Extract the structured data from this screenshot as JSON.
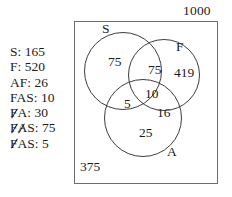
{
  "diagram": {
    "type": "venn-3-set",
    "universal_set_total": "1000",
    "outside_all_sets": "375",
    "set_labels": {
      "s": "S",
      "f": "F",
      "a": "A"
    },
    "regions": {
      "s_only": "75",
      "s_and_f_only": "75",
      "f_only": "419",
      "s_and_a_only": "5",
      "all_three": "10",
      "f_and_a_only": "16",
      "a_only": "25"
    }
  },
  "given_values": [
    {
      "term": "S",
      "value": "165",
      "text": "S: 165",
      "struck_letters": []
    },
    {
      "term": "F",
      "value": "520",
      "text": "F: 520",
      "struck_letters": []
    },
    {
      "term": "AF",
      "value": "26",
      "text": "AF: 26",
      "struck_letters": []
    },
    {
      "term": "FAS",
      "value": "10",
      "text": "FAS: 10",
      "struck_letters": []
    },
    {
      "term": "FA",
      "value": "30",
      "text": "FA: 30",
      "struck_letters": [
        "F"
      ]
    },
    {
      "term": "FAS",
      "value": "75",
      "text": "FAS: 75",
      "struck_letters": [
        "F",
        "A"
      ]
    },
    {
      "term": "FAS",
      "value": "5",
      "text": "FAS: 5",
      "struck_letters": [
        "F"
      ]
    }
  ],
  "given_list_lines": {
    "l0_label": "S:",
    "l0_value": "165",
    "l1_label": "F:",
    "l1_value": "520",
    "l2_label": "AF:",
    "l2_value": "26",
    "l3_label": "FAS:",
    "l3_value": "10",
    "l4_f": "F",
    "l4_rest": "A:",
    "l4_value": "30",
    "l5_f": "F",
    "l5_a": "A",
    "l5_rest": "S:",
    "l5_value": "75",
    "l6_f": "F",
    "l6_rest": "AS:",
    "l6_value": "5"
  }
}
